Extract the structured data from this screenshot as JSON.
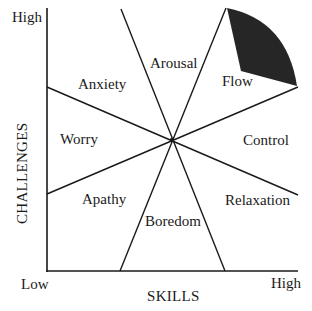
{
  "diagram": {
    "axes": {
      "x": {
        "title": "SKILLS",
        "low": "Low",
        "high": "High"
      },
      "y": {
        "title": "CHALLENGES",
        "low": "Low",
        "high": "High"
      }
    },
    "regions": [
      {
        "id": "arousal",
        "label": "Arousal"
      },
      {
        "id": "flow",
        "label": "Flow"
      },
      {
        "id": "anxiety",
        "label": "Anxiety"
      },
      {
        "id": "worry",
        "label": "Worry"
      },
      {
        "id": "control",
        "label": "Control"
      },
      {
        "id": "apathy",
        "label": "Apathy"
      },
      {
        "id": "relaxation",
        "label": "Relaxation"
      },
      {
        "id": "boredom",
        "label": "Boredom"
      }
    ],
    "highlight": {
      "region": "flow",
      "color": "#262626"
    },
    "colors": {
      "line": "#1a1a1a",
      "background": "#ffffff"
    }
  }
}
